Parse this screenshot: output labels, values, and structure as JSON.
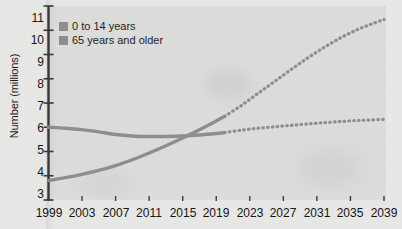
{
  "chart_data": {
    "type": "line",
    "title": "",
    "xlabel": "",
    "ylabel": "Number (millions)",
    "xlim": [
      1999,
      2039
    ],
    "ylim": [
      3,
      11
    ],
    "grid": false,
    "legend_position": "top-left",
    "xticks": [
      "1999",
      "2003",
      "2007",
      "2011",
      "2015",
      "2019",
      "2023",
      "2027",
      "2031",
      "2035",
      "2039"
    ],
    "yticks": [
      "3",
      "4",
      "5",
      "6",
      "7",
      "8",
      "9",
      "10",
      "11"
    ],
    "projection_start_year": 2020,
    "series": [
      {
        "name": "0 to 14 years",
        "color": "#8e8e8e",
        "x": [
          1999,
          2001,
          2003,
          2005,
          2007,
          2009,
          2011,
          2013,
          2015,
          2017,
          2019,
          2020
        ],
        "values": [
          6.0,
          5.96,
          5.9,
          5.81,
          5.7,
          5.64,
          5.62,
          5.62,
          5.64,
          5.68,
          5.74,
          5.78
        ],
        "projected_x": [
          2020,
          2022,
          2024,
          2026,
          2028,
          2030,
          2032,
          2034,
          2036,
          2038,
          2039
        ],
        "projected_values": [
          5.78,
          5.88,
          5.96,
          6.02,
          6.08,
          6.14,
          6.19,
          6.24,
          6.28,
          6.31,
          6.33
        ]
      },
      {
        "name": "65 years and older",
        "color": "#8e8e8e",
        "x": [
          1999,
          2001,
          2003,
          2005,
          2007,
          2009,
          2011,
          2013,
          2015,
          2017,
          2019,
          2020
        ],
        "values": [
          3.8,
          3.92,
          4.06,
          4.22,
          4.42,
          4.66,
          4.94,
          5.24,
          5.56,
          5.9,
          6.26,
          6.45
        ],
        "projected_x": [
          2020,
          2022,
          2024,
          2026,
          2028,
          2030,
          2032,
          2034,
          2036,
          2038,
          2039
        ],
        "projected_values": [
          6.45,
          6.9,
          7.4,
          7.9,
          8.4,
          8.88,
          9.32,
          9.72,
          10.05,
          10.32,
          10.44
        ]
      }
    ]
  },
  "legend": {
    "items": [
      {
        "label": "0 to 14 years",
        "color": "#8e8e8e"
      },
      {
        "label": "65 years and older",
        "color": "#8e8e8e"
      }
    ]
  },
  "axes": {
    "y_title": "Number (millions)"
  },
  "colors": {
    "page_background": "#e8e8e6",
    "plot_background": "#dcdcda",
    "axis": "#3a3a3a",
    "text": "#141414",
    "series": "#8e8e8e"
  }
}
